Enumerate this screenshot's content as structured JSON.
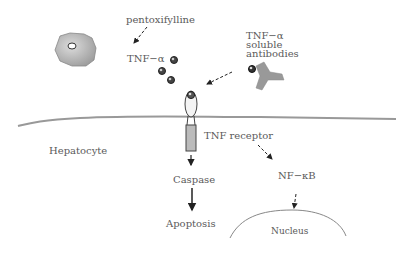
{
  "labels": {
    "pentoxifylline": "pentoxifylline",
    "tnf_alpha": "TNF−α",
    "antibodies_line1": "TNF−α",
    "antibodies_line2": "soluble",
    "antibodies_line3": "antibodies",
    "tnf_receptor": "TNF receptor",
    "hepatocyte": "Hepatocyte",
    "caspase": "Caspase",
    "apoptosis": "Apoptosis",
    "nfkb": "NF−κB",
    "nucleus": "Nucleus"
  },
  "colors": {
    "membrane": "#999999",
    "shape_fill": "#aaaaaa",
    "receptor_fill": "#bbbbbb",
    "text": "#5a5a5a",
    "arrow": "#222222"
  }
}
